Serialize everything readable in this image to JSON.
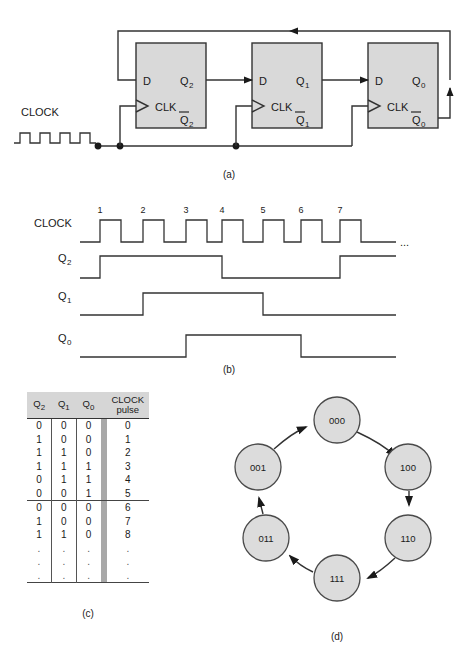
{
  "figure": {
    "parts": [
      "(a)",
      "(b)",
      "(c)",
      "(d)"
    ],
    "colors": {
      "flipflop_fill": "#d9d9d9",
      "state_fill": "#dcdcdc",
      "line": "#333333",
      "table_header_fill": "#d6d6d6",
      "table_separator_fill": "#a8a8a8"
    }
  },
  "circuit": {
    "caption": "(a)",
    "clock_label": "CLOCK",
    "flipflops": [
      {
        "d": "D",
        "clk": "CLK",
        "q": "Q",
        "q_sub": "2",
        "qbar": "Q",
        "qbar_sub": "2"
      },
      {
        "d": "D",
        "clk": "CLK",
        "q": "Q",
        "q_sub": "1",
        "qbar": "Q",
        "qbar_sub": "1"
      },
      {
        "d": "D",
        "clk": "CLK",
        "q": "Q",
        "q_sub": "0",
        "qbar": "Q",
        "qbar_sub": "0"
      }
    ]
  },
  "timing": {
    "caption": "(b)",
    "pulse_numbers": [
      "1",
      "2",
      "3",
      "4",
      "5",
      "6",
      "7"
    ],
    "ellipsis": "...",
    "rows": [
      {
        "label": "CLOCK",
        "sub": ""
      },
      {
        "label": "Q",
        "sub": "2"
      },
      {
        "label": "Q",
        "sub": "1"
      },
      {
        "label": "Q",
        "sub": "0"
      }
    ],
    "waveforms": {
      "clock_first_rise_x": 100,
      "clock_period": 43,
      "clock_pulse_count": 7,
      "q2_rise_pulse": 1,
      "q2_fall_pulse": 4,
      "q2_rise2_pulse": 7,
      "q1_rise_pulse": 2,
      "q1_fall_pulse": 5,
      "q0_rise_pulse": 3,
      "q0_fall_pulse": 6
    }
  },
  "table": {
    "caption": "(c)",
    "headers": [
      "Q",
      "Q",
      "Q",
      "CLOCK"
    ],
    "header_subs": [
      "2",
      "1",
      "0",
      ""
    ],
    "header_clock_line2": "pulse",
    "rows": [
      {
        "q2": "0",
        "q1": "0",
        "q0": "0",
        "pulse": "0",
        "divider": false
      },
      {
        "q2": "1",
        "q1": "0",
        "q0": "0",
        "pulse": "1",
        "divider": false
      },
      {
        "q2": "1",
        "q1": "1",
        "q0": "0",
        "pulse": "2",
        "divider": false
      },
      {
        "q2": "1",
        "q1": "1",
        "q0": "1",
        "pulse": "3",
        "divider": false
      },
      {
        "q2": "0",
        "q1": "1",
        "q0": "1",
        "pulse": "4",
        "divider": false
      },
      {
        "q2": "0",
        "q1": "0",
        "q0": "1",
        "pulse": "5",
        "divider": false
      },
      {
        "q2": "0",
        "q1": "0",
        "q0": "0",
        "pulse": "6",
        "divider": true
      },
      {
        "q2": "1",
        "q1": "0",
        "q0": "0",
        "pulse": "7",
        "divider": false
      },
      {
        "q2": "1",
        "q1": "1",
        "q0": "0",
        "pulse": "8",
        "divider": false
      },
      {
        "q2": ".",
        "q1": ".",
        "q0": ".",
        "pulse": ".",
        "divider": false
      },
      {
        "q2": ".",
        "q1": ".",
        "q0": ".",
        "pulse": ".",
        "divider": false
      },
      {
        "q2": ".",
        "q1": ".",
        "q0": ".",
        "pulse": ".",
        "divider": false
      }
    ]
  },
  "state_diagram": {
    "caption": "(d)",
    "states": [
      {
        "label": "000",
        "cx": 337,
        "cy": 420
      },
      {
        "label": "100",
        "cx": 408,
        "cy": 467
      },
      {
        "label": "110",
        "cx": 408,
        "cy": 538
      },
      {
        "label": "111",
        "cx": 337,
        "cy": 578
      },
      {
        "label": "011",
        "cx": 266,
        "cy": 538
      },
      {
        "label": "001",
        "cx": 258,
        "cy": 467
      }
    ],
    "transitions": [
      {
        "from": "000",
        "to": "100"
      },
      {
        "from": "100",
        "to": "110"
      },
      {
        "from": "110",
        "to": "111"
      },
      {
        "from": "111",
        "to": "011"
      },
      {
        "from": "011",
        "to": "001"
      },
      {
        "from": "001",
        "to": "000"
      }
    ],
    "radius": 23
  }
}
